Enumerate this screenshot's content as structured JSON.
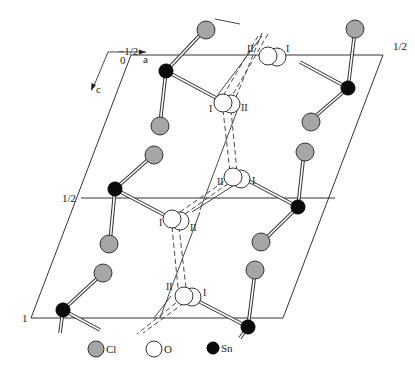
{
  "figure": {
    "type": "crystal-structure-projection",
    "axes": {
      "a_label": "a",
      "c_label": "c"
    },
    "cell_labels": {
      "origin_top": "−1/2",
      "origin_bottom": "0",
      "top_right": "1/2",
      "left_middle": "1/2",
      "left_bottom": "1"
    },
    "site_labels": {
      "one": "I",
      "two": "II"
    },
    "legend": [
      {
        "symbol": "Cl",
        "label": "Cl",
        "color": "#a6a6a6"
      },
      {
        "symbol": "O",
        "label": "O",
        "color": "#ffffff"
      },
      {
        "symbol": "Sn",
        "label": "Sn",
        "color": "#0a0a0a"
      }
    ],
    "colors": {
      "line": "#333333",
      "chlorine": "#a6a6a6",
      "oxygen": "#ffffff",
      "tin": "#0a0a0a"
    }
  }
}
